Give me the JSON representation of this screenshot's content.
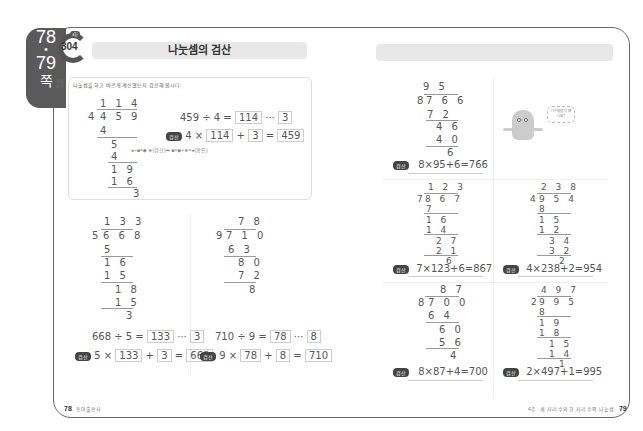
{
  "side_tab": {
    "page_from": "78",
    "page_to": "79",
    "suffix": "쪽"
  },
  "badge": {
    "top_label": "4일",
    "number": "304"
  },
  "title": "나눗셈의 검산",
  "side_label": "개념 원리",
  "example": {
    "instruction": "나눗셈을 하고 바르게 계산했는지 검산해 봅시다.",
    "division": {
      "divisor": "4",
      "dividend": "4 5 9",
      "quotient": "1 1 4",
      "steps": [
        "4",
        "5",
        "4",
        "1 9",
        "1 6",
        "3"
      ]
    },
    "equation": {
      "left": "459 ÷ 4 =",
      "quotient": "114",
      "sep": "···",
      "remainder": "3"
    },
    "check": {
      "pill": "검산",
      "a": "4 ×",
      "quotient": "114",
      "plus": "+",
      "remainder": "3",
      "eq": "=",
      "result": "459"
    },
    "hint": "●÷■=◆ ★(검산)➡ ■×◆+★=●(확인)"
  },
  "problems_left": [
    {
      "divisor": "5",
      "dividend": "6 6 8",
      "quotient": "1 3 3",
      "steps": [
        "5",
        "1 6",
        "1 5",
        "1 8",
        "1 5",
        "3"
      ],
      "equation": {
        "left": "668 ÷ 5 =",
        "quotient": "133",
        "sep": "···",
        "remainder": "3"
      },
      "check": {
        "pill": "검산",
        "a": "5 ×",
        "quotient": "133",
        "plus": "+",
        "remainder": "3",
        "eq": "=",
        "result": "668"
      }
    },
    {
      "divisor": "9",
      "dividend": "7 1 0",
      "quotient": "7 8",
      "steps": [
        "6 3",
        "8 0",
        "7 2",
        "8"
      ],
      "equation": {
        "left": "710 ÷ 9 =",
        "quotient": "78",
        "sep": "···",
        "remainder": "8"
      },
      "check": {
        "pill": "검산",
        "a": "9 ×",
        "quotient": "78",
        "plus": "+",
        "remainder": "8",
        "eq": "=",
        "result": "710"
      }
    }
  ],
  "problems_right": [
    {
      "divisor": "8",
      "dividend": "7 6 6",
      "quotient": "9 5",
      "steps": [
        "7 2",
        "4 6",
        "4 0",
        "6"
      ],
      "pill": "검산",
      "check": "8×95+6=766"
    },
    {
      "divisor": "7",
      "dividend": "8 6 7",
      "quotient": "1 2 3",
      "steps": [
        "7",
        "1 6",
        "1 4",
        "2 7",
        "2 1",
        "6"
      ],
      "pill": "검산",
      "check": "7×123+6=867"
    },
    {
      "divisor": "4",
      "dividend": "9 5 4",
      "quotient": "2 3 8",
      "steps": [
        "8",
        "1 5",
        "1 2",
        "3 4",
        "3 2",
        "2"
      ],
      "pill": "검산",
      "check": "4×238+2=954"
    },
    {
      "divisor": "8",
      "dividend": "7 0 0",
      "quotient": "8 7",
      "steps": [
        "6 4",
        "6 0",
        "5 6",
        "4"
      ],
      "pill": "검산",
      "check": "8×87+4=700"
    },
    {
      "divisor": "2",
      "dividend": "9 9 5",
      "quotient": "4 9 7",
      "steps": [
        "8",
        "1 9",
        "1 8",
        "1 5",
        "1 4",
        "1"
      ],
      "pill": "검산",
      "check": "2×497+1=995"
    }
  ],
  "mascot_bubble": "나눗셈을 다 했나요?",
  "footer_left": {
    "page": "78",
    "text": "동아출판사"
  },
  "footer_right": {
    "text": "4주 · 세 자리 수와 한 자리 수의 나눗셈",
    "page": "79"
  }
}
